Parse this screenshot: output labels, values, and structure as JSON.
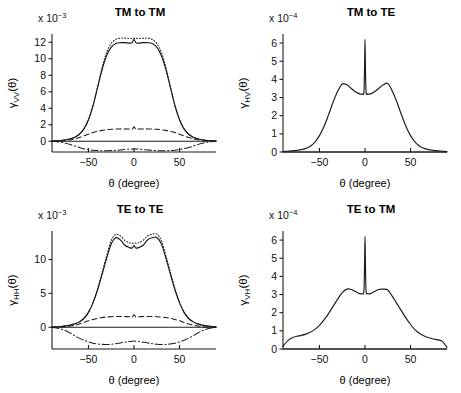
{
  "figure": {
    "xlabel": "θ (degree)",
    "theta_unit": "degree",
    "panel_count": 4
  },
  "panels": [
    {
      "id": "tm-to-tm",
      "title": "TM to TM",
      "ylabel_symbol": "γ",
      "ylabel_sub": "VV",
      "ylabel_arg": "(θ)",
      "exponent_prefix": "x 10",
      "exponent_power": "−3",
      "xticks": [
        -50,
        0,
        50
      ],
      "xticklabels": [
        "−50",
        "0",
        "50"
      ],
      "yticks": [
        0,
        2,
        4,
        6,
        8,
        10,
        12
      ],
      "yticklabels": [
        "0",
        "2",
        "4",
        "6",
        "8",
        "10",
        "12"
      ],
      "xlim": [
        -90,
        90
      ],
      "ylim": [
        -1.3,
        13.0
      ]
    },
    {
      "id": "tm-to-te",
      "title": "TM to TE",
      "ylabel_symbol": "γ",
      "ylabel_sub": "HV",
      "ylabel_arg": "(θ)",
      "exponent_prefix": "x 10",
      "exponent_power": "−4",
      "xticks": [
        -50,
        0,
        50
      ],
      "xticklabels": [
        "−50",
        "0",
        "50"
      ],
      "yticks": [
        0,
        1,
        2,
        3,
        4,
        5,
        6
      ],
      "yticklabels": [
        "0",
        "1",
        "2",
        "3",
        "4",
        "5",
        "6"
      ],
      "xlim": [
        -90,
        90
      ],
      "ylim": [
        0,
        6.5
      ]
    },
    {
      "id": "te-to-te",
      "title": "TE to TE",
      "ylabel_symbol": "γ",
      "ylabel_sub": "HH",
      "ylabel_arg": "(θ)",
      "exponent_prefix": "x 10",
      "exponent_power": "−3",
      "xticks": [
        -50,
        0,
        50
      ],
      "xticklabels": [
        "−50",
        "0",
        "50"
      ],
      "yticks": [
        0,
        5,
        10
      ],
      "yticklabels": [
        "0",
        "5",
        "10"
      ],
      "xlim": [
        -90,
        90
      ],
      "ylim": [
        -3.2,
        14.2
      ]
    },
    {
      "id": "te-to-tm",
      "title": "TE to TM",
      "ylabel_symbol": "γ",
      "ylabel_sub": "VH",
      "ylabel_arg": "(θ)",
      "exponent_prefix": "x 10",
      "exponent_power": "−4",
      "xticks": [
        -50,
        0,
        50
      ],
      "xticklabels": [
        "−50",
        "0",
        "50"
      ],
      "yticks": [
        0,
        1,
        2,
        3,
        4,
        5,
        6
      ],
      "yticklabels": [
        "0",
        "1",
        "2",
        "3",
        "4",
        "5",
        "6"
      ],
      "xlim": [
        -90,
        90
      ],
      "ylim": [
        0,
        6.5
      ]
    }
  ],
  "chart_data": [
    {
      "type": "line",
      "panel": "tm-to-tm",
      "title": "TM to TM",
      "xlabel": "θ (degree)",
      "ylabel": "γ_VV(θ)",
      "y_scale": "1e-3",
      "xlim": [
        -90,
        90
      ],
      "ylim": [
        -1.3,
        13.0
      ],
      "grid": false,
      "legend": "none",
      "x": [
        -90,
        -85,
        -80,
        -75,
        -70,
        -65,
        -60,
        -55,
        -50,
        -45,
        -40,
        -35,
        -30,
        -25,
        -20,
        -15,
        -10,
        -5,
        -2,
        0,
        2,
        5,
        10,
        15,
        20,
        25,
        30,
        35,
        40,
        45,
        50,
        55,
        60,
        65,
        70,
        75,
        80,
        85,
        90
      ],
      "series": [
        {
          "name": "total",
          "style": "solid",
          "values": [
            0.02,
            0.05,
            0.1,
            0.18,
            0.3,
            0.5,
            0.85,
            1.5,
            2.6,
            4.3,
            6.5,
            8.7,
            10.4,
            11.4,
            11.85,
            11.95,
            11.95,
            11.9,
            11.95,
            12.35,
            11.95,
            11.9,
            11.95,
            11.95,
            11.85,
            11.4,
            10.4,
            8.7,
            6.5,
            4.3,
            2.6,
            1.5,
            0.85,
            0.5,
            0.3,
            0.18,
            0.1,
            0.05,
            0.02
          ]
        },
        {
          "name": "upper-dotted",
          "style": "dotted",
          "values": [
            0.02,
            0.05,
            0.1,
            0.18,
            0.3,
            0.5,
            0.85,
            1.5,
            2.6,
            4.35,
            6.6,
            8.95,
            10.8,
            11.85,
            12.35,
            12.5,
            12.5,
            12.45,
            12.45,
            12.5,
            12.45,
            12.45,
            12.5,
            12.5,
            12.35,
            11.85,
            10.8,
            8.95,
            6.6,
            4.35,
            2.6,
            1.5,
            0.85,
            0.5,
            0.3,
            0.18,
            0.1,
            0.05,
            0.02
          ]
        },
        {
          "name": "dashed-component",
          "style": "dashed",
          "values": [
            0.0,
            0.02,
            0.05,
            0.1,
            0.18,
            0.3,
            0.45,
            0.65,
            0.85,
            1.05,
            1.2,
            1.32,
            1.4,
            1.45,
            1.48,
            1.5,
            1.5,
            1.48,
            1.46,
            1.75,
            1.46,
            1.48,
            1.5,
            1.5,
            1.48,
            1.45,
            1.4,
            1.32,
            1.2,
            1.05,
            0.85,
            0.65,
            0.45,
            0.3,
            0.18,
            0.1,
            0.05,
            0.02,
            0.0
          ]
        },
        {
          "name": "dashdot-component",
          "style": "dashdot",
          "values": [
            0.0,
            -0.05,
            -0.12,
            -0.25,
            -0.4,
            -0.58,
            -0.75,
            -0.9,
            -1.0,
            -1.08,
            -1.12,
            -1.15,
            -1.15,
            -1.13,
            -1.1,
            -1.05,
            -1.0,
            -0.95,
            -0.93,
            -0.92,
            -0.93,
            -0.95,
            -1.0,
            -1.05,
            -1.1,
            -1.13,
            -1.15,
            -1.15,
            -1.12,
            -1.08,
            -1.0,
            -0.9,
            -0.75,
            -0.58,
            -0.4,
            -0.25,
            -0.12,
            -0.05,
            0.0
          ]
        }
      ]
    },
    {
      "type": "line",
      "panel": "tm-to-te",
      "title": "TM to TE",
      "xlabel": "θ (degree)",
      "ylabel": "γ_HV(θ)",
      "y_scale": "1e-4",
      "xlim": [
        -90,
        90
      ],
      "ylim": [
        0,
        6.5
      ],
      "grid": false,
      "legend": "none",
      "x": [
        -90,
        -85,
        -80,
        -75,
        -70,
        -65,
        -60,
        -55,
        -50,
        -45,
        -40,
        -35,
        -30,
        -25,
        -20,
        -15,
        -10,
        -6,
        -3,
        -1.2,
        -0.5,
        0,
        0.5,
        1.2,
        3,
        6,
        10,
        15,
        20,
        25,
        30,
        35,
        40,
        45,
        50,
        55,
        60,
        65,
        70,
        75,
        80,
        85,
        90
      ],
      "series": [
        {
          "name": "total",
          "style": "solid",
          "values": [
            0.02,
            0.04,
            0.06,
            0.09,
            0.13,
            0.2,
            0.32,
            0.55,
            0.9,
            1.4,
            2.05,
            2.75,
            3.35,
            3.75,
            3.7,
            3.5,
            3.3,
            3.2,
            3.2,
            3.3,
            4.6,
            6.2,
            4.6,
            3.3,
            3.2,
            3.2,
            3.3,
            3.5,
            3.7,
            3.78,
            3.35,
            2.75,
            2.05,
            1.4,
            0.9,
            0.55,
            0.32,
            0.2,
            0.13,
            0.09,
            0.06,
            0.04,
            0.02
          ]
        }
      ]
    },
    {
      "type": "line",
      "panel": "te-to-te",
      "title": "TE to TE",
      "xlabel": "θ (degree)",
      "ylabel": "γ_HH(θ)",
      "y_scale": "1e-3",
      "xlim": [
        -90,
        90
      ],
      "ylim": [
        -3.2,
        14.2
      ],
      "grid": false,
      "legend": "none",
      "x": [
        -90,
        -85,
        -80,
        -75,
        -70,
        -65,
        -60,
        -55,
        -50,
        -45,
        -40,
        -35,
        -30,
        -25,
        -20,
        -15,
        -10,
        -5,
        -2,
        0,
        2,
        5,
        10,
        15,
        20,
        25,
        30,
        35,
        40,
        45,
        50,
        55,
        60,
        65,
        70,
        75,
        80,
        85,
        90
      ],
      "series": [
        {
          "name": "total",
          "style": "solid",
          "values": [
            0.05,
            0.08,
            0.12,
            0.2,
            0.32,
            0.5,
            0.8,
            1.3,
            2.2,
            3.6,
            5.5,
            7.8,
            10.2,
            12.3,
            13.2,
            12.9,
            12.1,
            11.75,
            11.7,
            12.05,
            11.7,
            11.75,
            12.1,
            12.9,
            13.2,
            13.25,
            12.3,
            10.2,
            7.8,
            5.5,
            3.6,
            2.2,
            1.3,
            0.8,
            0.5,
            0.32,
            0.2,
            0.12,
            0.05,
            0.0,
            0.0
          ]
        },
        {
          "name": "upper-dotted",
          "style": "dotted",
          "values": [
            0.05,
            0.08,
            0.12,
            0.2,
            0.32,
            0.5,
            0.8,
            1.3,
            2.2,
            3.7,
            5.7,
            8.1,
            10.6,
            12.8,
            13.7,
            13.5,
            12.8,
            12.45,
            12.4,
            12.45,
            12.4,
            12.45,
            12.8,
            13.5,
            13.7,
            13.75,
            12.8,
            10.6,
            8.1,
            5.7,
            3.7,
            2.2,
            1.3,
            0.8,
            0.5,
            0.32,
            0.2,
            0.12,
            0.05,
            0.0,
            0.0
          ]
        },
        {
          "name": "dashed-component",
          "style": "dashed",
          "values": [
            0.0,
            0.02,
            0.05,
            0.1,
            0.2,
            0.32,
            0.5,
            0.72,
            0.95,
            1.15,
            1.32,
            1.45,
            1.52,
            1.57,
            1.6,
            1.6,
            1.58,
            1.55,
            1.53,
            1.85,
            1.53,
            1.55,
            1.58,
            1.6,
            1.6,
            1.57,
            1.52,
            1.45,
            1.32,
            1.15,
            0.95,
            0.72,
            0.5,
            0.32,
            0.2,
            0.1,
            0.05,
            0.02,
            0.0
          ]
        },
        {
          "name": "dashdot-component",
          "style": "dashdot",
          "values": [
            0.0,
            -0.1,
            -0.25,
            -0.5,
            -0.85,
            -1.25,
            -1.6,
            -1.9,
            -2.15,
            -2.35,
            -2.45,
            -2.52,
            -2.55,
            -2.5,
            -2.42,
            -2.3,
            -2.2,
            -2.1,
            -2.05,
            -2.03,
            -2.05,
            -2.1,
            -2.2,
            -2.3,
            -2.42,
            -2.5,
            -2.55,
            -2.52,
            -2.45,
            -2.35,
            -2.15,
            -1.9,
            -1.6,
            -1.25,
            -0.85,
            -0.5,
            -0.25,
            -0.1,
            0.0
          ]
        }
      ]
    },
    {
      "type": "line",
      "panel": "te-to-tm",
      "title": "TE to TM",
      "xlabel": "θ (degree)",
      "ylabel": "γ_VH(θ)",
      "y_scale": "1e-4",
      "xlim": [
        -90,
        90
      ],
      "ylim": [
        0,
        6.5
      ],
      "grid": false,
      "legend": "none",
      "x": [
        -90,
        -85,
        -80,
        -75,
        -70,
        -65,
        -60,
        -55,
        -50,
        -45,
        -40,
        -35,
        -30,
        -25,
        -20,
        -15,
        -10,
        -6,
        -3,
        -1.2,
        -0.5,
        0,
        0.5,
        1.2,
        3,
        6,
        10,
        15,
        20,
        25,
        30,
        35,
        40,
        45,
        50,
        55,
        60,
        65,
        70,
        75,
        80,
        85,
        90
      ],
      "series": [
        {
          "name": "total",
          "style": "solid",
          "values": [
            0.15,
            0.45,
            0.62,
            0.7,
            0.75,
            0.82,
            0.92,
            1.08,
            1.3,
            1.6,
            1.95,
            2.35,
            2.75,
            3.1,
            3.3,
            3.28,
            3.15,
            3.05,
            3.05,
            3.2,
            4.6,
            6.2,
            4.6,
            3.2,
            3.05,
            3.05,
            3.15,
            3.28,
            3.3,
            3.25,
            2.9,
            2.5,
            2.1,
            1.7,
            1.35,
            1.05,
            0.85,
            0.72,
            0.62,
            0.55,
            0.5,
            0.42,
            0.08
          ]
        }
      ]
    }
  ]
}
